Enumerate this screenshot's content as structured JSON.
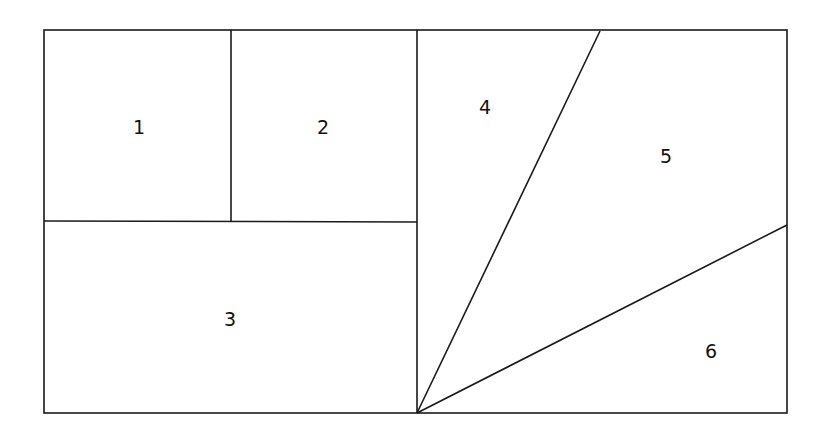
{
  "diagram": {
    "type": "partitioned-rectangle",
    "stroke_color": "#1a1a1a",
    "background": "#ffffff",
    "outer": {
      "x1": 44,
      "y1": 30,
      "x2": 787,
      "y2": 413
    },
    "lines": [
      {
        "name": "center-divider",
        "x1": 417,
        "y1": 30,
        "x2": 417,
        "y2": 413
      },
      {
        "name": "left-horizontal-divider",
        "x1": 44,
        "y1": 221,
        "x2": 417,
        "y2": 222
      },
      {
        "name": "divider-1-2",
        "x1": 231,
        "y1": 30,
        "x2": 231,
        "y2": 221
      },
      {
        "name": "diagonal-4-5",
        "x1": 417,
        "y1": 413,
        "x2": 600,
        "y2": 31
      },
      {
        "name": "diagonal-5-6",
        "x1": 417,
        "y1": 413,
        "x2": 787,
        "y2": 225
      }
    ],
    "regions": [
      {
        "id": "1",
        "label": "1",
        "x": 139,
        "y": 128
      },
      {
        "id": "2",
        "label": "2",
        "x": 323,
        "y": 128
      },
      {
        "id": "3",
        "label": "3",
        "x": 230,
        "y": 320
      },
      {
        "id": "4",
        "label": "4",
        "x": 485,
        "y": 108
      },
      {
        "id": "5",
        "label": "5",
        "x": 666,
        "y": 157
      },
      {
        "id": "6",
        "label": "6",
        "x": 711,
        "y": 352
      }
    ]
  }
}
